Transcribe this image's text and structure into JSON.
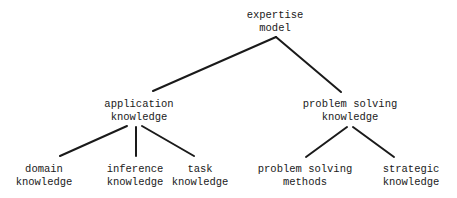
{
  "diagram": {
    "type": "tree",
    "line_color": "#1a1a1a",
    "root": {
      "line1": "expertise",
      "line2": "model"
    },
    "level1": [
      {
        "line1": "application",
        "line2": "knowledge"
      },
      {
        "line1": "problem solving",
        "line2": "knowledge"
      }
    ],
    "level2": [
      {
        "parent": "application knowledge",
        "line1": "domain",
        "line2": "knowledge"
      },
      {
        "parent": "application knowledge",
        "line1": "inference",
        "line2": "knowledge"
      },
      {
        "parent": "application knowledge",
        "line1": "task",
        "line2": "knowledge"
      },
      {
        "parent": "problem solving knowledge",
        "line1": "problem solving",
        "line2": "methods"
      },
      {
        "parent": "problem solving knowledge",
        "line1": "strategic",
        "line2": "knowledge"
      }
    ]
  }
}
